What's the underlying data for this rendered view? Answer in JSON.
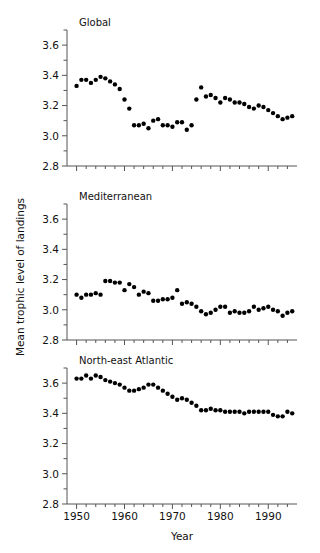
{
  "figure": {
    "ylabel": "Mean trophic  level of landings",
    "xlabel": "Year"
  },
  "chart_data": [
    {
      "type": "scatter",
      "title": "Global",
      "xlabel": "Year",
      "ylabel": "Mean trophic level of landings",
      "xlim": [
        1948,
        1996
      ],
      "ylim": [
        2.8,
        3.7
      ],
      "yticks": [
        2.8,
        3.0,
        3.2,
        3.4,
        3.6
      ],
      "ytick_labels": [
        "2.8",
        "3.0",
        "3.2",
        "3.4",
        "3.6"
      ],
      "yticks_minor": [
        2.9,
        3.1,
        3.3,
        3.5,
        3.7
      ],
      "xticks": [
        1950,
        1960,
        1970,
        1980,
        1990
      ],
      "xtick_labels": [
        "1950",
        "1960",
        "1970",
        "1980",
        "1990"
      ],
      "grid": false,
      "legend": "none",
      "marker": "filled-circle",
      "marker_color": "#000000",
      "x": [
        1950,
        1951,
        1952,
        1953,
        1954,
        1955,
        1956,
        1957,
        1958,
        1959,
        1960,
        1961,
        1962,
        1963,
        1964,
        1965,
        1966,
        1967,
        1968,
        1969,
        1970,
        1971,
        1972,
        1973,
        1974,
        1975,
        1976,
        1977,
        1978,
        1979,
        1980,
        1981,
        1982,
        1983,
        1984,
        1985,
        1986,
        1987,
        1988,
        1989,
        1990,
        1991,
        1992,
        1993,
        1994,
        1995
      ],
      "y": [
        3.33,
        3.37,
        3.37,
        3.35,
        3.37,
        3.39,
        3.38,
        3.36,
        3.34,
        3.31,
        3.24,
        3.18,
        3.07,
        3.07,
        3.08,
        3.05,
        3.1,
        3.11,
        3.07,
        3.07,
        3.06,
        3.09,
        3.09,
        3.04,
        3.07,
        3.24,
        3.32,
        3.26,
        3.27,
        3.25,
        3.22,
        3.25,
        3.24,
        3.22,
        3.22,
        3.21,
        3.19,
        3.18,
        3.2,
        3.19,
        3.17,
        3.15,
        3.13,
        3.11,
        3.12,
        3.13
      ]
    },
    {
      "type": "scatter",
      "title": "Mediterranean",
      "xlabel": "Year",
      "ylabel": "Mean trophic level of landings",
      "xlim": [
        1948,
        1996
      ],
      "ylim": [
        2.8,
        3.7
      ],
      "yticks": [
        2.8,
        3.0,
        3.2,
        3.4,
        3.6
      ],
      "ytick_labels": [
        "2.8",
        "3.0",
        "3.2",
        "3.4",
        "3.6"
      ],
      "yticks_minor": [
        2.9,
        3.1,
        3.3,
        3.5,
        3.7
      ],
      "xticks": [
        1950,
        1960,
        1970,
        1980,
        1990
      ],
      "xtick_labels": [
        "1950",
        "1960",
        "1970",
        "1980",
        "1990"
      ],
      "grid": false,
      "legend": "none",
      "marker": "filled-circle",
      "marker_color": "#000000",
      "x": [
        1950,
        1951,
        1952,
        1953,
        1954,
        1955,
        1956,
        1957,
        1958,
        1959,
        1960,
        1961,
        1962,
        1963,
        1964,
        1965,
        1966,
        1967,
        1968,
        1969,
        1970,
        1971,
        1972,
        1973,
        1974,
        1975,
        1976,
        1977,
        1978,
        1979,
        1980,
        1981,
        1982,
        1983,
        1984,
        1985,
        1986,
        1987,
        1988,
        1989,
        1990,
        1991,
        1992,
        1993,
        1994,
        1995
      ],
      "y": [
        3.1,
        3.08,
        3.1,
        3.1,
        3.11,
        3.1,
        3.19,
        3.19,
        3.18,
        3.18,
        3.13,
        3.17,
        3.15,
        3.1,
        3.12,
        3.11,
        3.06,
        3.06,
        3.07,
        3.07,
        3.08,
        3.13,
        3.04,
        3.05,
        3.04,
        3.02,
        2.99,
        2.97,
        2.98,
        3.0,
        3.02,
        3.02,
        2.98,
        2.99,
        2.98,
        2.98,
        2.99,
        3.02,
        3.0,
        3.01,
        3.02,
        3.0,
        2.99,
        2.96,
        2.98,
        2.99
      ]
    },
    {
      "type": "scatter",
      "title": "North-east Atlantic",
      "xlabel": "Year",
      "ylabel": "Mean trophic level of landings",
      "xlim": [
        1948,
        1996
      ],
      "ylim": [
        2.8,
        3.7
      ],
      "yticks": [
        2.8,
        3.0,
        3.2,
        3.4,
        3.6
      ],
      "ytick_labels": [
        "2.8",
        "3.0",
        "3.2",
        "3.4",
        "3.6"
      ],
      "yticks_minor": [
        2.9,
        3.1,
        3.3,
        3.5,
        3.7
      ],
      "xticks": [
        1950,
        1960,
        1970,
        1980,
        1990
      ],
      "xtick_labels": [
        "1950",
        "1960",
        "1970",
        "1980",
        "1990"
      ],
      "grid": false,
      "legend": "none",
      "marker": "filled-circle",
      "marker_color": "#000000",
      "x": [
        1950,
        1951,
        1952,
        1953,
        1954,
        1955,
        1956,
        1957,
        1958,
        1959,
        1960,
        1961,
        1962,
        1963,
        1964,
        1965,
        1966,
        1967,
        1968,
        1969,
        1970,
        1971,
        1972,
        1973,
        1974,
        1975,
        1976,
        1977,
        1978,
        1979,
        1980,
        1981,
        1982,
        1983,
        1984,
        1985,
        1986,
        1987,
        1988,
        1989,
        1990,
        1991,
        1992,
        1993,
        1994,
        1995
      ],
      "y": [
        3.63,
        3.63,
        3.65,
        3.63,
        3.65,
        3.64,
        3.62,
        3.61,
        3.6,
        3.59,
        3.57,
        3.55,
        3.55,
        3.56,
        3.57,
        3.59,
        3.59,
        3.57,
        3.55,
        3.53,
        3.51,
        3.49,
        3.5,
        3.49,
        3.47,
        3.45,
        3.42,
        3.42,
        3.43,
        3.42,
        3.42,
        3.41,
        3.41,
        3.41,
        3.41,
        3.4,
        3.41,
        3.41,
        3.41,
        3.41,
        3.41,
        3.39,
        3.38,
        3.38,
        3.41,
        3.4
      ]
    }
  ]
}
